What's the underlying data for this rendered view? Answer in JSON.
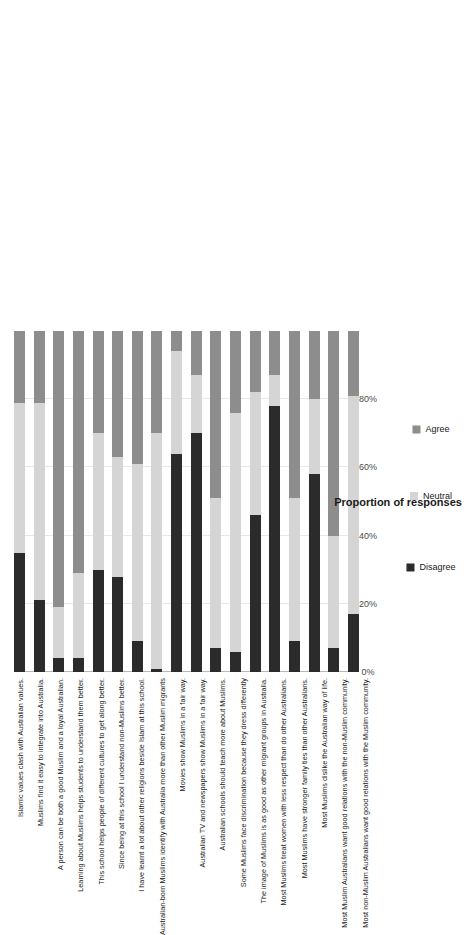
{
  "chart_data": {
    "type": "bar",
    "subtype": "stacked-horizontal-100",
    "title": "",
    "xlabel": "Proportion of responses",
    "ylabel": "",
    "xlim": [
      0,
      100
    ],
    "xticks": [
      "0%",
      "20%",
      "40%",
      "60%",
      "80%"
    ],
    "xtick_values": [
      0,
      20,
      40,
      60,
      80
    ],
    "grid": true,
    "legend_position": "bottom",
    "legend": [
      "Disagree",
      "Neutral",
      "Agree"
    ],
    "colors": {
      "disagree": "#2b2b2b",
      "neutral": "#d5d5d5",
      "agree": "#8d8d8d",
      "gridline": "#e8e8e8",
      "axis": "#b9b9b9",
      "text": "#1a1a1a"
    },
    "categories": [
      "Islamic values clash with Australian values.",
      "Muslims find it easy to integrate into Australia.",
      "A person can be both a good Muslim and a loyal Australian.",
      "Learning about Muslims helps students to understand them better.",
      "This school helps people of different cultures to get along better.",
      "Since being at this school I understand non-Muslims better.",
      "I have learnt a lot about other religions beside Islam at this school.",
      "Australian-born Muslims identify with Australia more than other Muslim migrants",
      "Movies show Muslims in a fair way.",
      "Australian TV and newspapers show Muslims in a fair way.",
      "Australian schools should teach more about Muslims.",
      "Some Muslims face discrimination because they dress differently",
      "The image of Muslims is as good as other migrant groups in Australia.",
      "Most Muslims treat women with less respect than do other Australians.",
      "Most Muslims have stronger family ties than other Australians.",
      "Most Muslims dislike the Australian way of life.",
      "Most Muslim Australians want good relations with the non-Muslim community.",
      "Most non-Muslim Australians want good relations with the Muslim community."
    ],
    "series": [
      {
        "name": "Disagree",
        "values": [
          35,
          21,
          4,
          4,
          30,
          28,
          9,
          1,
          64,
          70,
          7,
          6,
          46,
          78,
          9,
          58,
          7,
          17
        ]
      },
      {
        "name": "Neutral",
        "values": [
          44,
          58,
          15,
          25,
          40,
          35,
          52,
          69,
          30,
          17,
          44,
          70,
          36,
          9,
          42,
          22,
          33,
          64
        ]
      },
      {
        "name": "Agree",
        "values": [
          21,
          21,
          81,
          71,
          30,
          37,
          39,
          30,
          6,
          13,
          49,
          24,
          18,
          13,
          49,
          20,
          60,
          19
        ]
      }
    ]
  }
}
